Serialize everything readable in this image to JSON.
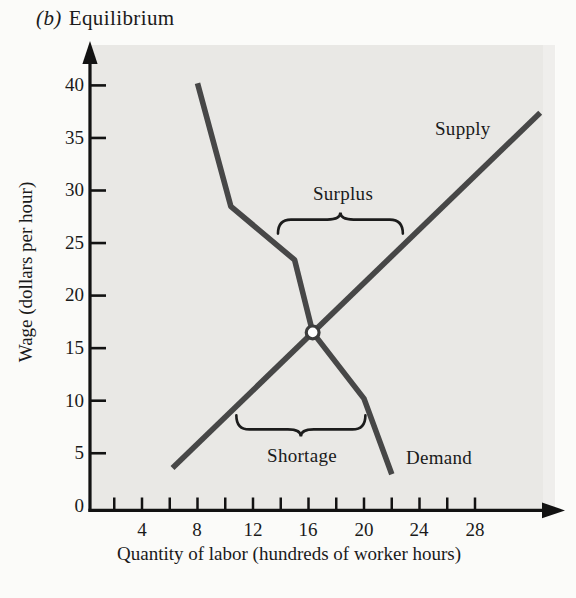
{
  "title": {
    "prefix": "(b)",
    "text": "Equilibrium"
  },
  "colors": {
    "page_bg": "#fbfbf9",
    "plot_bg": "#e9e8e5",
    "curve": "#474747",
    "axis": "#121212",
    "text": "#1a1a1a",
    "equilibrium_fill": "#ffffff"
  },
  "labels": {
    "supply": "Supply",
    "demand": "Demand",
    "surplus": "Surplus",
    "shortage": "Shortage"
  },
  "chart_data": {
    "type": "line",
    "xlabel": "Quantity of labor (hundreds of worker hours)",
    "ylabel": "Wage (dollars per hour)",
    "xlim": [
      0,
      34
    ],
    "ylim": [
      0,
      42
    ],
    "grid": false,
    "legend_position": "inline-labels",
    "x_minor_ticks": [
      2,
      4,
      6,
      8,
      10,
      12,
      14,
      16,
      18,
      20,
      22,
      24,
      26,
      28
    ],
    "x_tick_values": [
      4,
      8,
      12,
      16,
      20,
      24,
      28
    ],
    "x_tick_labels": [
      "4",
      "8",
      "12",
      "16",
      "20",
      "24",
      "28"
    ],
    "y_tick_values": [
      5,
      10,
      15,
      20,
      25,
      30,
      35,
      40
    ],
    "y_tick_labels": [
      "40",
      "35",
      "30",
      "25",
      "20",
      "15",
      "10",
      "5",
      "0"
    ],
    "series": [
      {
        "name": "Demand",
        "points": [
          [
            8,
            40.2
          ],
          [
            10.4,
            28.5
          ],
          [
            15,
            23.4
          ],
          [
            16.3,
            16.5
          ],
          [
            20,
            10.2
          ],
          [
            22,
            3
          ]
        ]
      },
      {
        "name": "Supply",
        "points": [
          [
            6.2,
            3.6
          ],
          [
            32.7,
            37.4
          ]
        ]
      }
    ],
    "equilibrium_point": {
      "q": 16.3,
      "w": 16.5,
      "style": "open-circle"
    },
    "annotations": [
      {
        "label": "Surplus",
        "type": "brace",
        "direction": "up",
        "q_from": 13.8,
        "q_to": 22.8,
        "w": 25.9,
        "meaning": "at wage ~25, quantity supplied exceeds quantity demanded"
      },
      {
        "label": "Shortage",
        "type": "brace",
        "direction": "down",
        "q_from": 10.8,
        "q_to": 20.1,
        "w": 8.6,
        "meaning": "at wage ~7.5, quantity demanded exceeds quantity supplied"
      }
    ]
  }
}
